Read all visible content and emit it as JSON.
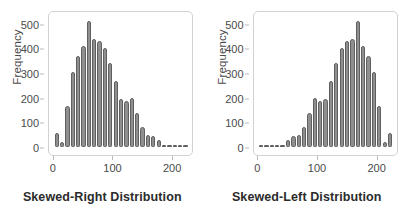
{
  "figure": {
    "background_color": "#ffffff",
    "bar_fill_color": "#8f8f8f",
    "bar_edge_color": "#606060",
    "frame_color": "#d2d2d2",
    "text_color": "#4a4a4a",
    "title_color": "#2b2b2b"
  },
  "chart_data": [
    {
      "type": "bar",
      "title": "",
      "xlabel": "Skewed-Right Distribution",
      "ylabel": "Frequency",
      "xlim": [
        -8,
        235
      ],
      "ylim": [
        0,
        540
      ],
      "grid": false,
      "legend": null,
      "xticks": [
        0,
        100,
        200
      ],
      "xticklabels": [
        "0",
        "100",
        "200"
      ],
      "yticks": [
        0,
        100,
        200,
        300,
        400,
        500
      ],
      "yticklabels": [
        "0",
        "100",
        "200",
        "300",
        "400",
        "500"
      ],
      "bin_width": 9,
      "x": [
        5,
        14,
        23,
        32,
        41,
        50,
        59,
        68,
        77,
        86,
        95,
        104,
        113,
        122,
        131,
        140,
        149,
        158,
        167,
        176,
        185,
        194,
        203,
        212,
        221
      ],
      "values": [
        55,
        20,
        168,
        305,
        368,
        410,
        510,
        440,
        432,
        400,
        340,
        267,
        195,
        185,
        200,
        140,
        82,
        50,
        45,
        30,
        10,
        8,
        7,
        6,
        5
      ]
    },
    {
      "type": "bar",
      "title": "",
      "xlabel": "Skewed-Left Distribution",
      "ylabel": "Frequency",
      "xlim": [
        -8,
        235
      ],
      "ylim": [
        0,
        540
      ],
      "grid": false,
      "legend": null,
      "xticks": [
        0,
        100,
        200
      ],
      "xticklabels": [
        "0",
        "100",
        "200"
      ],
      "yticks": [
        0,
        100,
        200,
        300,
        400,
        500
      ],
      "yticklabels": [
        "0",
        "100",
        "200",
        "300",
        "400",
        "500"
      ],
      "bin_width": 9,
      "x": [
        5,
        14,
        23,
        32,
        41,
        50,
        59,
        68,
        77,
        86,
        95,
        104,
        113,
        122,
        131,
        140,
        149,
        158,
        167,
        176,
        185,
        194,
        203,
        212,
        221
      ],
      "values": [
        5,
        6,
        7,
        8,
        10,
        30,
        45,
        50,
        82,
        140,
        200,
        185,
        195,
        267,
        340,
        400,
        432,
        440,
        510,
        410,
        368,
        305,
        168,
        20,
        55
      ]
    }
  ]
}
